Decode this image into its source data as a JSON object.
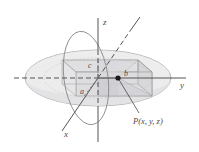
{
  "figure": {
    "kind": "ellipsoid-with-inscribed-box",
    "background_color": "#ffffff",
    "axes": {
      "x_label": "x",
      "y_label": "y",
      "z_label": "z",
      "axis_color": "#555555",
      "origin": {
        "x": 98,
        "y": 78
      }
    },
    "dimensions": {
      "a_label": "a",
      "b_label": "b",
      "c_label": "c"
    },
    "point": {
      "label": "P(x, y, z)",
      "marker_color": "#1a1a1a",
      "position": {
        "x": 118,
        "y": 78
      }
    },
    "surfaces": {
      "ellipsoid_fill": "#e9e9ea",
      "ellipsoid_stroke": "#9a9a9a",
      "box_fill": "#dcdcde",
      "box_stroke": "#8e8e8e",
      "highlight_fill": "#d2d2d5"
    }
  }
}
